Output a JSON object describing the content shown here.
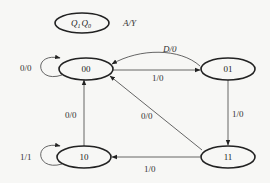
{
  "diagram": {
    "type": "state-transition",
    "legend": {
      "state_label_q1": "Q",
      "state_sub_q1": "1",
      "state_label_q0": "Q",
      "state_sub_q0": "0",
      "transition_format": "A/Y"
    },
    "states": [
      {
        "id": "s00",
        "label": "00"
      },
      {
        "id": "s01",
        "label": "01"
      },
      {
        "id": "s10",
        "label": "10"
      },
      {
        "id": "s11",
        "label": "11"
      }
    ],
    "transitions": [
      {
        "from": "00",
        "to": "00",
        "label": "0/0"
      },
      {
        "from": "00",
        "to": "01",
        "label": "1/0"
      },
      {
        "from": "01",
        "to": "00",
        "label": "D/0"
      },
      {
        "from": "01",
        "to": "11",
        "label": "1/0"
      },
      {
        "from": "11",
        "to": "10",
        "label": "1/0"
      },
      {
        "from": "11",
        "to": "00",
        "label": "0/0"
      },
      {
        "from": "10",
        "to": "00",
        "label": "0/0"
      },
      {
        "from": "10",
        "to": "10",
        "label": "1/1"
      }
    ]
  }
}
